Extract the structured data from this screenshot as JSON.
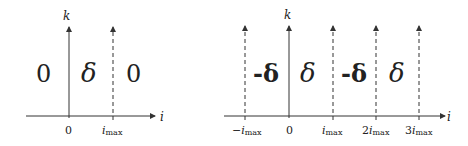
{
  "left_diagram": {
    "vertical_axis_label": "k",
    "horizontal_axis_label": "i",
    "regions": [
      "0",
      "δ",
      "0"
    ],
    "ticks": [
      {
        "base": "0",
        "sub": ""
      },
      {
        "base": "i",
        "sub": "max"
      }
    ]
  },
  "right_diagram": {
    "vertical_axis_label": "k",
    "horizontal_axis_label": "i",
    "regions": [
      "-δ",
      "δ",
      "-δ",
      "δ"
    ],
    "ticks": [
      {
        "prefix": "−",
        "base": "i",
        "sub": "max"
      },
      {
        "prefix": "",
        "base": "0",
        "sub": ""
      },
      {
        "prefix": "",
        "base": "i",
        "sub": "max"
      },
      {
        "prefix": "2",
        "base": "i",
        "sub": "max"
      },
      {
        "prefix": "3",
        "base": "i",
        "sub": "max"
      }
    ]
  },
  "colors": {
    "line": "#333333",
    "background": "#ffffff"
  }
}
